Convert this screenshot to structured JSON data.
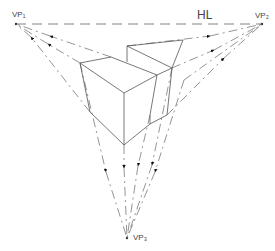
{
  "labels": {
    "horizon": "HL",
    "vp1": "VP₁",
    "vp2": "VP₂",
    "vp3": "VP₃"
  },
  "colors": {
    "line": "#555555",
    "arrow": "#111111",
    "background": "#ffffff"
  }
}
